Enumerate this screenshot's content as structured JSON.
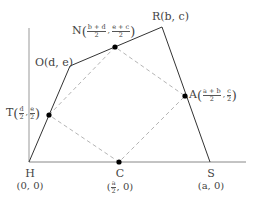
{
  "diagram": {
    "type": "coordinate-geometry",
    "colors": {
      "axis": "#888888",
      "quad": "#333333",
      "dashed": "#b0b0b0",
      "point": "#000000",
      "text": "#444444"
    },
    "points": {
      "H": {
        "label": "H",
        "coord": "(0, 0)",
        "x": 29,
        "y": 162
      },
      "S": {
        "label": "S",
        "coord": "(a, 0)",
        "x": 210,
        "y": 162
      },
      "R": {
        "label": "R(b, c)",
        "x": 162,
        "y": 27
      },
      "O": {
        "label": "O(d, e)",
        "x": 70,
        "y": 66
      },
      "N": {
        "letter": "N",
        "num1": "b + d",
        "den1": "2",
        "num2": "e + c",
        "den2": "2",
        "x": 115,
        "y": 47
      },
      "A": {
        "letter": "A",
        "num1": "a + b",
        "den1": "2",
        "num2": "c",
        "den2": "2",
        "x": 185,
        "y": 96
      },
      "T": {
        "letter": "T",
        "num1": "d",
        "den1": "2",
        "num2": "e",
        "den2": "2",
        "x": 49,
        "y": 115
      },
      "C": {
        "label": "C",
        "num1": "a",
        "den1": "2",
        "tail": ", 0)",
        "head": "(",
        "x": 119,
        "y": 162
      }
    },
    "axes": {
      "x_axis": {
        "x1": 29,
        "y1": 162,
        "x2": 246,
        "y2": 162
      },
      "y_axis": {
        "x1": 29,
        "y1": 162,
        "x2": 29,
        "y2": 28
      }
    }
  }
}
